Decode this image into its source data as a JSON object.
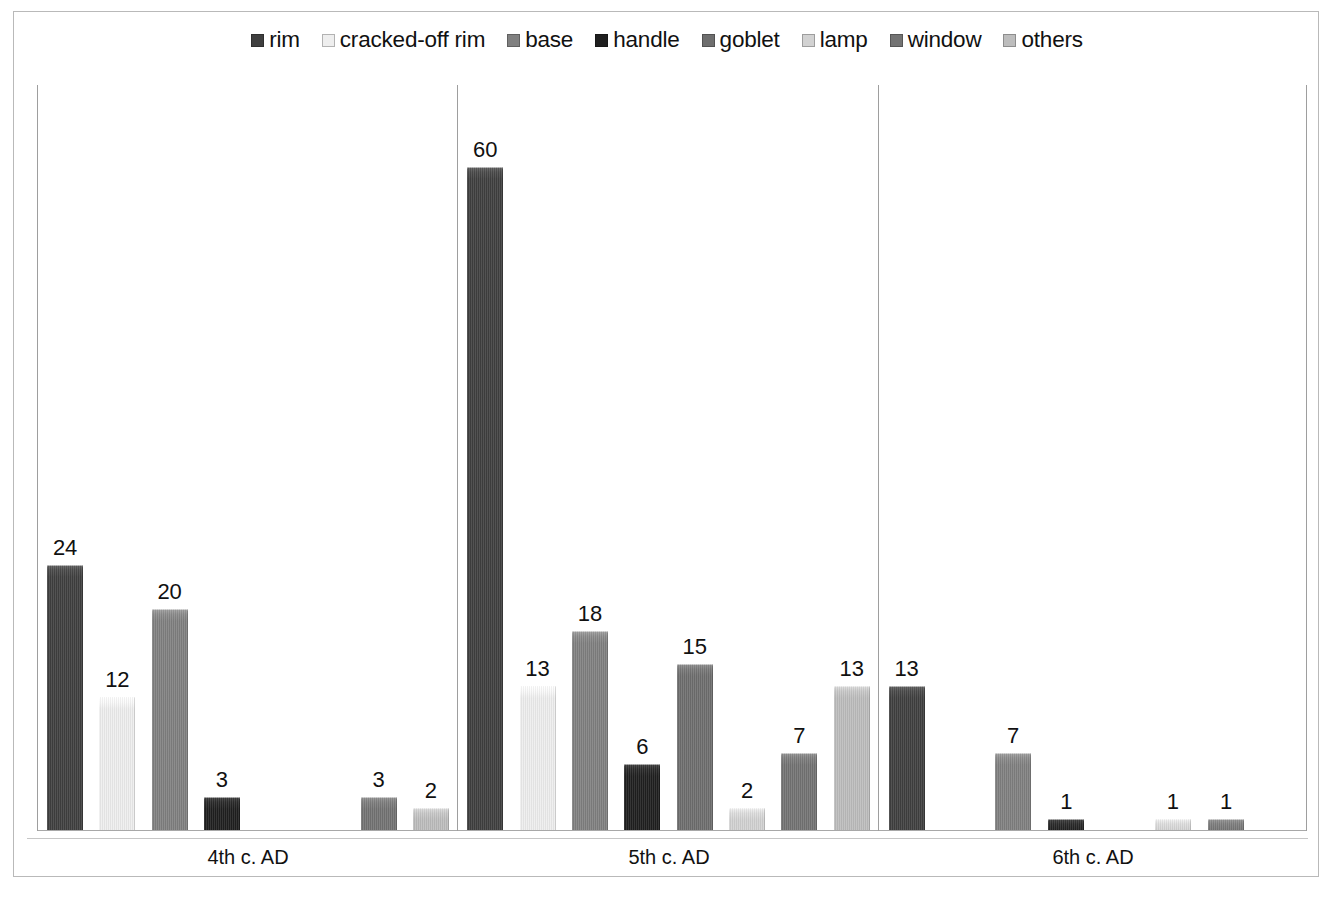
{
  "chart_data": {
    "type": "bar",
    "title": "",
    "subtitle": "",
    "xlabel": "",
    "ylabel": "",
    "grid": false,
    "legend_position": "top-center",
    "ylim": [
      0,
      60
    ],
    "categories": [
      "4th c. AD",
      "5th c. AD",
      "6th c. AD"
    ],
    "series": [
      {
        "name": "rim",
        "color": "#3f3f3f",
        "values": [
          24,
          60,
          13
        ]
      },
      {
        "name": "cracked-off rim",
        "color": "#eeeeee",
        "values": [
          12,
          13,
          0
        ]
      },
      {
        "name": "base",
        "color": "#808080",
        "values": [
          20,
          18,
          7
        ]
      },
      {
        "name": "handle",
        "color": "#1f1f1f",
        "values": [
          3,
          6,
          1
        ]
      },
      {
        "name": "goblet",
        "color": "#6e6e6e",
        "values": [
          0,
          15,
          0
        ]
      },
      {
        "name": "lamp",
        "color": "#d2d2d2",
        "values": [
          0,
          2,
          1
        ]
      },
      {
        "name": "window",
        "color": "#737373",
        "values": [
          3,
          7,
          1
        ]
      },
      {
        "name": "others",
        "color": "#bdbdbd",
        "values": [
          2,
          13,
          0
        ]
      }
    ],
    "value_labels_shown": true,
    "zero_bars_hidden": true
  },
  "legend": {
    "items": [
      {
        "label": "rim",
        "swatch": "#3f3f3f"
      },
      {
        "label": "cracked-off rim",
        "swatch": "#eeeeee"
      },
      {
        "label": "base",
        "swatch": "#808080"
      },
      {
        "label": "handle",
        "swatch": "#1f1f1f"
      },
      {
        "label": "goblet",
        "swatch": "#6e6e6e"
      },
      {
        "label": "lamp",
        "swatch": "#d2d2d2"
      },
      {
        "label": "window",
        "swatch": "#737373"
      },
      {
        "label": "others",
        "swatch": "#bdbdbd"
      }
    ]
  },
  "axis": {
    "frame_color": "#b9b9b9",
    "baseline_color": "#a8a8a8",
    "separator_color": "#9e9e9e"
  }
}
